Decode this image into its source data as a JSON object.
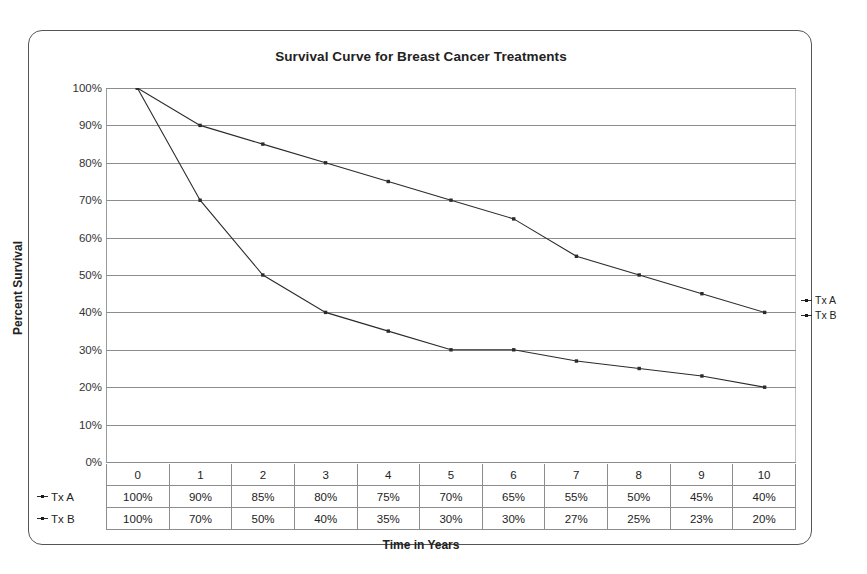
{
  "chart_data": {
    "type": "line",
    "title": "Survival Curve for Breast Cancer Treatments",
    "xlabel": "Time in Years",
    "ylabel": "Percent Survival",
    "categories": [
      "0",
      "1",
      "2",
      "3",
      "4",
      "5",
      "6",
      "7",
      "8",
      "9",
      "10"
    ],
    "ylim": [
      0,
      100
    ],
    "ytick_labels": [
      "100%",
      "90%",
      "80%",
      "70%",
      "60%",
      "50%",
      "40%",
      "30%",
      "20%",
      "10%",
      "0%"
    ],
    "ytick_values": [
      100,
      90,
      80,
      70,
      60,
      50,
      40,
      30,
      20,
      10,
      0
    ],
    "grid": "horizontal",
    "legend_position": "right",
    "series": [
      {
        "name": "Tx A",
        "color": "#2b2b2b",
        "values": [
          100,
          90,
          85,
          80,
          75,
          70,
          65,
          55,
          50,
          45,
          40
        ],
        "labels": [
          "100%",
          "90%",
          "85%",
          "80%",
          "75%",
          "70%",
          "65%",
          "55%",
          "50%",
          "45%",
          "40%"
        ]
      },
      {
        "name": "Tx B",
        "color": "#2b2b2b",
        "values": [
          100,
          70,
          50,
          40,
          35,
          30,
          30,
          27,
          25,
          23,
          20
        ],
        "labels": [
          "100%",
          "70%",
          "50%",
          "40%",
          "35%",
          "30%",
          "30%",
          "27%",
          "25%",
          "23%",
          "20%"
        ]
      }
    ]
  },
  "table": {
    "header": [
      "0",
      "1",
      "2",
      "3",
      "4",
      "5",
      "6",
      "7",
      "8",
      "9",
      "10"
    ],
    "rows": [
      {
        "label": "Tx A",
        "cells": [
          "100%",
          "90%",
          "85%",
          "80%",
          "75%",
          "70%",
          "65%",
          "55%",
          "50%",
          "45%",
          "40%"
        ]
      },
      {
        "label": "Tx B",
        "cells": [
          "100%",
          "70%",
          "50%",
          "40%",
          "35%",
          "30%",
          "30%",
          "27%",
          "25%",
          "23%",
          "20%"
        ]
      }
    ]
  },
  "legend": {
    "items": [
      {
        "label": "Tx A"
      },
      {
        "label": "Tx B"
      }
    ]
  },
  "colors": {
    "series": "#2b2b2b",
    "gridline": "#8d8d8d",
    "frame": "#555555"
  }
}
